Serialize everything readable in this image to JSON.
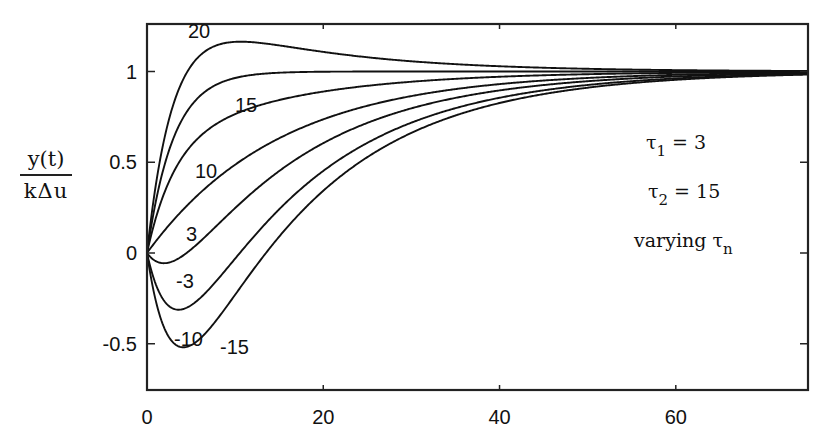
{
  "chart_data": {
    "type": "line",
    "title": "",
    "xlabel": "",
    "ylabel": {
      "numerator": "y(t)",
      "denominator": "kΔu"
    },
    "xlim": [
      0,
      75
    ],
    "ylim": [
      -0.75,
      1.26
    ],
    "x_ticks": [
      0,
      20,
      40,
      60
    ],
    "x_tick_labels": [
      "0",
      "20",
      "40",
      "60"
    ],
    "y_ticks": [
      -0.5,
      0,
      0.5,
      1
    ],
    "y_tick_labels": [
      "-0.5",
      "0",
      "0.5",
      "1"
    ],
    "grid": false,
    "legend": "none (curves labeled inline)",
    "model": "y(t) = 1 + (tau_n - tau1)/(tau1 - tau2) * exp(-t/tau1) + (tau2 - tau_n)/(tau1 - tau2) * exp(-t/tau2)",
    "parameters": {
      "tau1": 3,
      "tau2": 15
    },
    "series": [
      {
        "name": "20",
        "tau_n": 20,
        "label_pos": {
          "x": 188,
          "y": 18
        },
        "peak_approx": 1.17
      },
      {
        "name": "15",
        "tau_n": 15,
        "label_pos": {
          "x": 235,
          "y": 92
        }
      },
      {
        "name": "10",
        "tau_n": 10,
        "label_pos": {
          "x": 195,
          "y": 158
        }
      },
      {
        "name": "3",
        "tau_n": 3,
        "label_pos": {
          "x": 186,
          "y": 221
        }
      },
      {
        "name": "-3",
        "tau_n": -3,
        "label_pos": {
          "x": 176,
          "y": 268
        }
      },
      {
        "name": "-10",
        "tau_n": -10,
        "label_pos": {
          "x": 174,
          "y": 326
        },
        "min_approx": -0.3
      },
      {
        "name": "-15",
        "tau_n": -15,
        "label_pos": {
          "x": 220,
          "y": 334
        },
        "min_approx": -0.52
      }
    ],
    "sample_values": {
      "t": [
        0,
        2,
        4,
        6,
        10,
        15,
        20,
        30,
        40,
        50,
        60,
        75
      ],
      "20": [
        0,
        0.834,
        1.051,
        1.123,
        1.166,
        1.158,
        1.14,
        1.105,
        1.076,
        1.055,
        1.04,
        1.024
      ],
      "15": [
        0,
        0.487,
        0.736,
        0.865,
        0.964,
        0.994,
        0.999,
        1.0,
        1.0,
        1.0,
        1.0,
        1.0
      ],
      "10": [
        0,
        0.25,
        0.484,
        0.622,
        0.77,
        0.852,
        0.894,
        0.94,
        0.964,
        0.978,
        0.987,
        0.993
      ],
      "3": [
        0,
        0.125,
        0.235,
        0.33,
        0.487,
        0.632,
        0.736,
        0.865,
        0.931,
        0.964,
        0.982,
        0.993
      ],
      "-3": [
        0,
        -0.044,
        -0.015,
        0.049,
        0.199,
        0.367,
        0.5,
        0.701,
        0.838,
        0.912,
        0.952,
        0.978
      ],
      "-10": [
        0,
        -0.246,
        -0.31,
        -0.238,
        -0.062,
        0.143,
        0.311,
        0.562,
        0.73,
        0.848,
        0.918,
        0.96
      ],
      "-15": [
        0,
        -0.38,
        -0.52,
        -0.468,
        -0.254,
        -0.004,
        0.2,
        0.507,
        0.695,
        0.822,
        0.9,
        0.954
      ]
    }
  },
  "annotation": {
    "line1": {
      "symbol": "τ",
      "sub": "1",
      "text": " = 3"
    },
    "line2": {
      "symbol": "τ",
      "sub": "2",
      "text": " = 15"
    },
    "line3": {
      "prefix": "varying ",
      "symbol": "τ",
      "sub": "n"
    }
  },
  "style": {
    "line_color": "#111111",
    "frame_color": "#222222",
    "background": "#ffffff"
  }
}
